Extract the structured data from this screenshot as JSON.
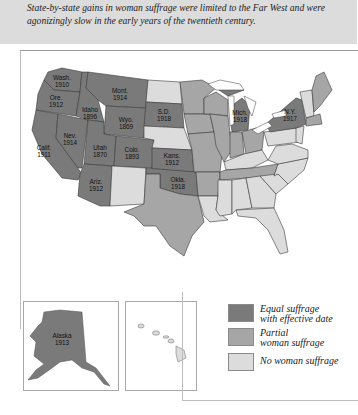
{
  "caption": "State-by-state gains in woman suffrage were limited to the Far West and were agonizingly slow in the early years of the twentieth century.",
  "colors": {
    "equal": "#7a7a7a",
    "partial": "#a6a6a6",
    "none": "#dcdcdc",
    "border": "#3a3a3a"
  },
  "legend": {
    "items": [
      {
        "label_line1": "Equal suffrage",
        "label_line2": "with effective date",
        "color": "#7a7a7a"
      },
      {
        "label_line1": "Partial",
        "label_line2": "woman suffrage",
        "color": "#a6a6a6"
      },
      {
        "label_line1": "No woman suffrage",
        "label_line2": "",
        "color": "#dcdcdc"
      }
    ]
  },
  "states": [
    {
      "name": "Wash.",
      "year": "1910"
    },
    {
      "name": "Ore.",
      "year": "1912"
    },
    {
      "name": "Calif.",
      "year": "1911"
    },
    {
      "name": "Idaho",
      "year": "1896"
    },
    {
      "name": "Nev.",
      "year": "1914"
    },
    {
      "name": "Mont.",
      "year": "1914"
    },
    {
      "name": "Wyo.",
      "year": "1869"
    },
    {
      "name": "Utah",
      "year": "1870"
    },
    {
      "name": "Colo.",
      "year": "1893"
    },
    {
      "name": "Ariz.",
      "year": "1912"
    },
    {
      "name": "S.D.",
      "year": "1918"
    },
    {
      "name": "Kans.",
      "year": "1912"
    },
    {
      "name": "Okla.",
      "year": "1918"
    },
    {
      "name": "Mich.",
      "year": "1918"
    },
    {
      "name": "N.Y.",
      "year": "1917"
    }
  ],
  "insets": {
    "alaska": {
      "name": "Alaska",
      "year": "1913"
    },
    "hawaii": {
      "name": ""
    }
  }
}
